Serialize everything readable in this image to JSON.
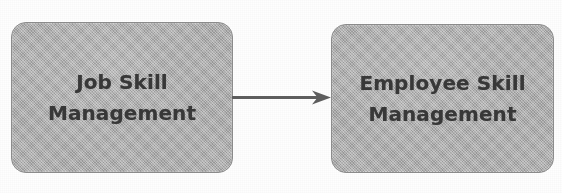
{
  "diagram": {
    "type": "flow-diagram",
    "background_color": "#fefefe",
    "nodes": [
      {
        "id": "job-skill-management",
        "label_line1": "Job Skill",
        "label_line2": "Management",
        "shape": "rounded-rectangle",
        "fill_color": "#a9a9a9",
        "border_color": "#8d8d8d",
        "text_color": "#383838"
      },
      {
        "id": "employee-skill-management",
        "label_line1": "Employee Skill",
        "label_line2": "Management",
        "shape": "rounded-rectangle",
        "fill_color": "#a9a9a9",
        "border_color": "#8d8d8d",
        "text_color": "#383838"
      }
    ],
    "edges": [
      {
        "id": "job-to-employee",
        "from": "job-skill-management",
        "to": "employee-skill-management",
        "style": "solid",
        "direction": "right",
        "arrowhead": "open-triangle",
        "color": "#5d5d5d",
        "label": ""
      }
    ]
  }
}
